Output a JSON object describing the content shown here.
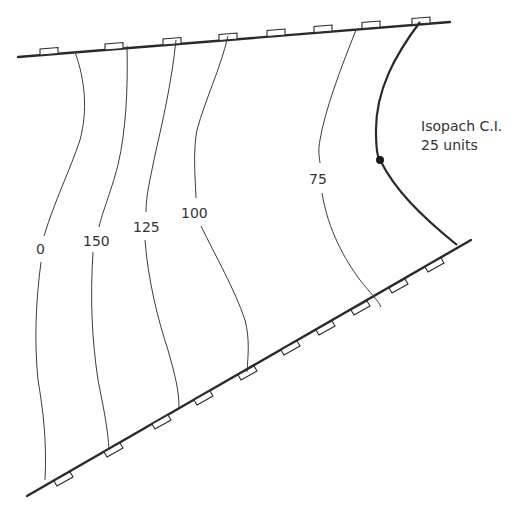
{
  "diagram": {
    "type": "isopach map",
    "contour_labels": [
      "0",
      "150",
      "125",
      "100",
      "75"
    ],
    "contour_interval_note": {
      "line1": "Isopach C.I.",
      "line2": "25 units"
    },
    "contours": [
      {
        "value": "0",
        "label_pos": [
          42,
          249
        ]
      },
      {
        "value": "150",
        "label_pos": [
          95,
          240
        ]
      },
      {
        "value": "125",
        "label_pos": [
          145,
          226
        ]
      },
      {
        "value": "100",
        "label_pos": [
          196,
          212
        ]
      },
      {
        "value": "75",
        "label_pos": [
          320,
          178
        ]
      }
    ],
    "features": {
      "upper_fault": "normal fault with ticks on upthrown side",
      "lower_fault": "normal fault with ticks on downthrown side",
      "zero_edge_point": "well / control point"
    },
    "colors": {
      "line": "#2a2a2a",
      "text": "#333333",
      "background": "#ffffff"
    }
  }
}
